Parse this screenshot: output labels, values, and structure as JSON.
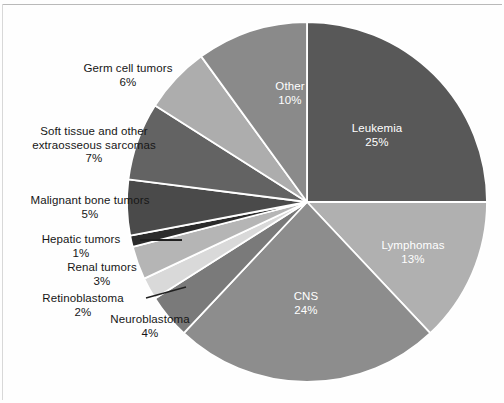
{
  "figure": {
    "background_color": "#fefefe",
    "rule_color": "#b9b9b9"
  },
  "chart_data": {
    "type": "pie",
    "title": "",
    "subtitle": "",
    "xlabel": "",
    "ylabel": "",
    "legend_position": "none",
    "grid": false,
    "units": "percent",
    "start_angle_deg": 0,
    "direction": "clockwise",
    "total": 100,
    "categories": [
      "Leukemia",
      "Lymphomas",
      "CNS",
      "Neuroblastoma",
      "Retinoblastoma",
      "Renal tumors",
      "Hepatic tumors",
      "Malignant bone tumors",
      "Soft tissue and other extraosseous sarcomas",
      "Germ cell tumors",
      "Other"
    ],
    "values": [
      25,
      13,
      24,
      4,
      2,
      3,
      1,
      5,
      7,
      6,
      10
    ],
    "colors": [
      "#585858",
      "#b0b0b0",
      "#8d8d8d",
      "#7a7a7a",
      "#d9d9d9",
      "#b5b5b5",
      "#2b2b2b",
      "#4a4a4a",
      "#636363",
      "#adadad",
      "#8a8a8a"
    ],
    "slices": [
      {
        "label": "Leukemia",
        "percent_text": "25%",
        "value": 25,
        "color": "#585858",
        "label_placement": "inside",
        "label_color": "#ffffff"
      },
      {
        "label": "Lymphomas",
        "percent_text": "13%",
        "value": 13,
        "color": "#b0b0b0",
        "label_placement": "inside",
        "label_color": "#ffffff"
      },
      {
        "label": "CNS",
        "percent_text": "24%",
        "value": 24,
        "color": "#8d8d8d",
        "label_placement": "inside",
        "label_color": "#ffffff"
      },
      {
        "label": "Neuroblastoma",
        "percent_text": "4%",
        "value": 4,
        "color": "#7a7a7a",
        "label_placement": "outside",
        "label_color": "#161616"
      },
      {
        "label": "Retinoblastoma",
        "percent_text": "2%",
        "value": 2,
        "color": "#d9d9d9",
        "label_placement": "outside-leader",
        "label_color": "#161616"
      },
      {
        "label": "Renal tumors",
        "percent_text": "3%",
        "value": 3,
        "color": "#b5b5b5",
        "label_placement": "outside",
        "label_color": "#161616"
      },
      {
        "label": "Hepatic tumors",
        "percent_text": "1%",
        "value": 1,
        "color": "#2b2b2b",
        "label_placement": "outside-leader",
        "label_color": "#161616"
      },
      {
        "label": "Malignant bone tumors",
        "percent_text": "5%",
        "value": 5,
        "color": "#4a4a4a",
        "label_placement": "outside",
        "label_color": "#161616"
      },
      {
        "label": "Soft tissue and other extraosseous sarcomas",
        "label_line1": "Soft tissue and other",
        "label_line2": "extraosseous sarcomas",
        "percent_text": "7%",
        "value": 7,
        "color": "#636363",
        "label_placement": "outside",
        "label_color": "#161616"
      },
      {
        "label": "Germ cell tumors",
        "percent_text": "6%",
        "value": 6,
        "color": "#adadad",
        "label_placement": "outside",
        "label_color": "#161616"
      },
      {
        "label": "Other",
        "percent_text": "10%",
        "value": 10,
        "color": "#8a8a8a",
        "label_placement": "inside",
        "label_color": "#ffffff"
      }
    ]
  },
  "labels": {
    "leukemia": {
      "name": "Leukemia",
      "pct": "25%"
    },
    "lymphomas": {
      "name": "Lymphomas",
      "pct": "13%"
    },
    "cns": {
      "name": "CNS",
      "pct": "24%"
    },
    "neuroblastoma": {
      "name": "Neuroblastoma",
      "pct": "4%"
    },
    "retinoblastoma": {
      "name": "Retinoblastoma",
      "pct": "2%"
    },
    "renal": {
      "name": "Renal tumors",
      "pct": "3%"
    },
    "hepatic": {
      "name": "Hepatic tumors",
      "pct": "1%"
    },
    "bone": {
      "name": "Malignant bone tumors",
      "pct": "5%"
    },
    "soft_tissue": {
      "line1": "Soft tissue and other",
      "line2": "extraosseous sarcomas",
      "pct": "7%"
    },
    "germ_cell": {
      "name": "Germ cell tumors",
      "pct": "6%"
    },
    "other": {
      "name": "Other",
      "pct": "10%"
    }
  }
}
